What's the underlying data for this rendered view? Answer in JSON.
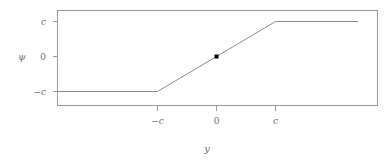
{
  "figure": {
    "background_color": "#ffffff",
    "width": 389,
    "height": 162
  },
  "axes": {
    "x_title": "y",
    "y_title": "ψ",
    "x_tick_labels": [
      "−c",
      "0",
      "c"
    ],
    "y_tick_labels": [
      "c",
      "0",
      "−c"
    ],
    "frame_color": "#9a9a9a",
    "tick_color": "#9a9a9a",
    "label_color": "#6e6e6e"
  },
  "chart_data": {
    "type": "line",
    "title": "",
    "subtitle": "",
    "xlabel": "y",
    "ylabel": "ψ",
    "grid": false,
    "legend": "none",
    "xlim": [
      -2.7,
      2.4
    ],
    "ylim": [
      -1.45,
      1.45
    ],
    "xticks": [
      -1,
      0,
      1
    ],
    "xticklabels": [
      "−c",
      "0",
      "c"
    ],
    "yticks": [
      1,
      0,
      -1
    ],
    "yticklabels": [
      "c",
      "0",
      "−c"
    ],
    "series": [
      {
        "name": "Huber psi function",
        "type": "line",
        "color": "#8c8c8c",
        "x": [
          -2.7,
          -1,
          1,
          2.4
        ],
        "y": [
          -1,
          -1,
          1,
          1
        ]
      }
    ],
    "points": [
      {
        "name": "origin-marker",
        "x": 0,
        "y": 0,
        "marker": "square",
        "color": "#000000"
      }
    ],
    "annotations": []
  }
}
